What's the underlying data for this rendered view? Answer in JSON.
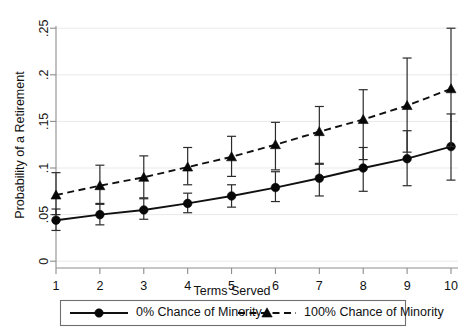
{
  "chart_data": {
    "type": "line",
    "title": "",
    "subtitle": "",
    "xlabel": "Terms Served",
    "ylabel": "Probability of a Retirement",
    "x": [
      1,
      2,
      3,
      4,
      5,
      6,
      7,
      8,
      9,
      10
    ],
    "categories": [
      "1",
      "2",
      "3",
      "4",
      "5",
      "6",
      "7",
      "8",
      "9",
      "10"
    ],
    "xlim": [
      0.6,
      10.5
    ],
    "ylim": [
      0,
      0.26
    ],
    "xticks": [
      1,
      2,
      3,
      4,
      5,
      6,
      7,
      8,
      9,
      10
    ],
    "xtick_labels": [
      "1",
      "2",
      "3",
      "4",
      "5",
      "6",
      "7",
      "8",
      "9",
      "10"
    ],
    "yticks": [
      0,
      0.05,
      0.1,
      0.15,
      0.2,
      0.25
    ],
    "ytick_labels": [
      "0",
      ".05",
      ".1",
      ".15",
      ".2",
      ".25"
    ],
    "grid": "horizontal",
    "legend_position": "bottom",
    "error_bars": "95% confidence interval",
    "series": [
      {
        "name": "0% Chance of Minority",
        "marker": "circle",
        "linestyle": "solid",
        "color": "#080808",
        "values": [
          0.044,
          0.05,
          0.055,
          0.062,
          0.07,
          0.079,
          0.089,
          0.1,
          0.11,
          0.123
        ],
        "ci_lower": [
          0.033,
          0.039,
          0.045,
          0.052,
          0.058,
          0.064,
          0.07,
          0.075,
          0.081,
          0.087
        ],
        "ci_upper": [
          0.056,
          0.062,
          0.067,
          0.073,
          0.082,
          0.096,
          0.105,
          0.122,
          0.14,
          0.158
        ]
      },
      {
        "name": "100% Chance of Minority",
        "marker": "triangle",
        "linestyle": "dashed",
        "color": "#080808",
        "values": [
          0.071,
          0.081,
          0.09,
          0.101,
          0.112,
          0.125,
          0.139,
          0.152,
          0.167,
          0.185
        ],
        "ci_lower": [
          0.05,
          0.061,
          0.068,
          0.082,
          0.091,
          0.098,
          0.104,
          0.109,
          0.117,
          0.123
        ],
        "ci_upper": [
          0.095,
          0.103,
          0.113,
          0.122,
          0.134,
          0.149,
          0.166,
          0.184,
          0.218,
          0.25
        ]
      }
    ]
  },
  "legend": {
    "items": [
      {
        "label": "0% Chance of Minority",
        "marker": "circle",
        "linestyle": "solid"
      },
      {
        "label": "100% Chance of Minority",
        "marker": "triangle",
        "linestyle": "dashed"
      }
    ]
  },
  "footer": {
    "clipped_note": ""
  }
}
